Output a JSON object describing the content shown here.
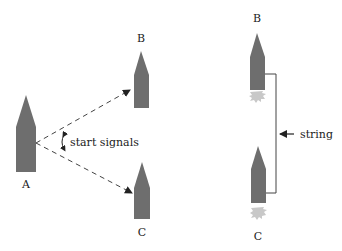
{
  "colors": {
    "rocket": "#6e6e6e",
    "flame": "#c8c8c8",
    "line": "#444444",
    "text": "#222222"
  },
  "left_panel": {
    "rockets": [
      {
        "id": "A",
        "label": "A"
      },
      {
        "id": "B",
        "label": "B"
      },
      {
        "id": "C",
        "label": "C"
      }
    ],
    "annotation": "start signals",
    "arrows": [
      {
        "from": "A",
        "to": "B",
        "style": "dashed"
      },
      {
        "from": "A",
        "to": "C",
        "style": "dashed"
      }
    ]
  },
  "right_panel": {
    "rockets": [
      {
        "id": "B",
        "label": "B",
        "flame": true
      },
      {
        "id": "C",
        "label": "C",
        "flame": true
      }
    ],
    "connector_label": "string"
  }
}
